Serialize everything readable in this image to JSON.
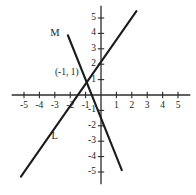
{
  "figure": {
    "background_color": "#ffffff",
    "ink_color": "#1c1c1c",
    "axis_color": "#2b2b2b"
  },
  "chart_data": {
    "type": "line",
    "title": "",
    "xlabel": "",
    "ylabel": "",
    "xlim": [
      -5.8,
      5.8
    ],
    "ylim": [
      -5.8,
      5.8
    ],
    "grid": false,
    "legend": "none",
    "x_ticks": [
      -5,
      -4,
      -3,
      -2,
      -1,
      1,
      2,
      3,
      4,
      5
    ],
    "y_ticks": [
      5,
      4,
      3,
      2,
      1,
      -1,
      -2,
      -3,
      -4,
      -5
    ],
    "x_tick_labels": [
      "-5",
      "-4",
      "-3",
      "-2",
      "-1",
      "1",
      "2",
      "3",
      "4",
      "5"
    ],
    "y_tick_labels": [
      "5",
      "4",
      "3",
      "2",
      "1",
      "-1",
      "-2",
      "-3",
      "-4",
      "-5"
    ],
    "series": [
      {
        "name": "L",
        "label": "L",
        "slope": 1.5,
        "intercept": 2.5,
        "x": [
          -5.2,
          2.3
        ],
        "y": [
          -5.3,
          5.45
        ],
        "label_x": -3.0,
        "label_y": -2.65
      },
      {
        "name": "M",
        "label": "M",
        "slope": -2.5,
        "intercept": -1.5,
        "x": [
          -2.15,
          1.35
        ],
        "y": [
          3.88,
          -4.88
        ],
        "label_x": -3.0,
        "label_y": 4.0
      }
    ],
    "annotations": [
      {
        "text": "(-1, 1)",
        "x": -1,
        "y": 1,
        "label_x": -1.45,
        "label_y": 1.45
      }
    ]
  }
}
